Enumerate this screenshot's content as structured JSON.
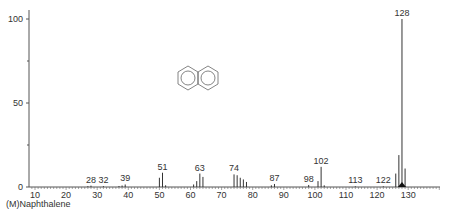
{
  "chart_data": {
    "type": "bar",
    "title": "",
    "caption": "(M)Naphthalene",
    "xlabel": "m/z",
    "ylabel": "Relative Intensity",
    "xlim": [
      8,
      140
    ],
    "ylim": [
      0,
      100
    ],
    "x_ticks": [
      10,
      20,
      30,
      40,
      50,
      60,
      70,
      80,
      90,
      100,
      110,
      120,
      130
    ],
    "y_ticks": [
      0,
      50,
      100
    ],
    "grid": false,
    "peaks": [
      {
        "mz": 27,
        "intensity": 0.5
      },
      {
        "mz": 28,
        "intensity": 0.8,
        "label": "28"
      },
      {
        "mz": 32,
        "intensity": 0.5,
        "label": "32"
      },
      {
        "mz": 37,
        "intensity": 0.6
      },
      {
        "mz": 38,
        "intensity": 0.9
      },
      {
        "mz": 39,
        "intensity": 1.5,
        "label": "39"
      },
      {
        "mz": 50,
        "intensity": 5.5
      },
      {
        "mz": 51,
        "intensity": 8.5,
        "label": "51"
      },
      {
        "mz": 52,
        "intensity": 1.0
      },
      {
        "mz": 61,
        "intensity": 1.5
      },
      {
        "mz": 62,
        "intensity": 3.5
      },
      {
        "mz": 63,
        "intensity": 8.0,
        "label": "63"
      },
      {
        "mz": 64,
        "intensity": 6.0
      },
      {
        "mz": 74,
        "intensity": 7.5,
        "label": "74"
      },
      {
        "mz": 75,
        "intensity": 7.0
      },
      {
        "mz": 76,
        "intensity": 5.5
      },
      {
        "mz": 77,
        "intensity": 4.5
      },
      {
        "mz": 78,
        "intensity": 3.0
      },
      {
        "mz": 86,
        "intensity": 1.0
      },
      {
        "mz": 87,
        "intensity": 1.8,
        "label": "87"
      },
      {
        "mz": 98,
        "intensity": 1.2,
        "label": "98"
      },
      {
        "mz": 101,
        "intensity": 3.5
      },
      {
        "mz": 102,
        "intensity": 12.0,
        "label": "102"
      },
      {
        "mz": 103,
        "intensity": 1.0
      },
      {
        "mz": 113,
        "intensity": 0.4,
        "label": "113"
      },
      {
        "mz": 122,
        "intensity": 0.4,
        "label": "122"
      },
      {
        "mz": 126,
        "intensity": 8.0
      },
      {
        "mz": 127,
        "intensity": 19.0
      },
      {
        "mz": 128,
        "intensity": 100.0,
        "label": "128"
      },
      {
        "mz": 129,
        "intensity": 11.0
      }
    ],
    "annotations": [
      "naphthalene structure drawing",
      "molecular ion marker at 128"
    ]
  }
}
